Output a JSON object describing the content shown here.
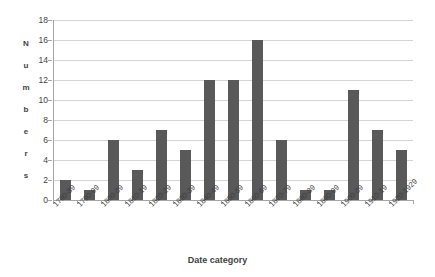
{
  "chart_data": {
    "type": "bar",
    "title": "",
    "subtitle": "",
    "xlabel": "Date category",
    "ylabel": "Numbers",
    "ylim": [
      0,
      18
    ],
    "ytick_step": 2,
    "yticks": [
      0,
      2,
      4,
      6,
      8,
      10,
      12,
      14,
      16,
      18
    ],
    "grid": true,
    "legend": false,
    "legend_position": "none",
    "bar_color": "#595959",
    "gridline_color": "#d4d4d4",
    "axis_color": "#a6a6a6",
    "text_color": "#3f3f3f",
    "background_color": "#ffffff",
    "xtick_rotation": -45,
    "categories": [
      "1780-89",
      "1790-99",
      "1800-09",
      "1810-19",
      "1820-29",
      "1830-39",
      "1840-49",
      "1850-59",
      "1860-69",
      "1870-79",
      "1880-89",
      "1890-99",
      "1900-09",
      "1910-19",
      "1920-1929"
    ],
    "values": [
      2,
      1,
      6,
      3,
      7,
      5,
      12,
      12,
      16,
      6,
      1,
      1,
      11,
      7,
      5
    ]
  },
  "axis": {
    "y_title_letters": [
      "N",
      "u",
      "m",
      "b",
      "e",
      "r",
      "s"
    ]
  }
}
